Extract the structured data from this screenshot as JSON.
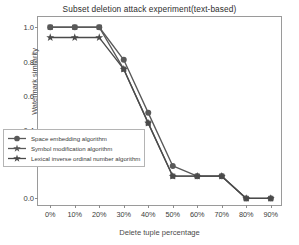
{
  "chart": {
    "title": "Subset deletion attack experiment(text-based)",
    "xlabel": "Delete tuple percentage",
    "ylabel": "Watermark similarity"
  },
  "chart_data": {
    "type": "line",
    "title": "Subset deletion attack experiment(text-based)",
    "xlabel": "Delete tuple percentage",
    "ylabel": "Watermark similarity",
    "categories": [
      "0%",
      "10%",
      "20%",
      "30%",
      "40%",
      "50%",
      "60%",
      "70%",
      "80%",
      "90%"
    ],
    "x_tick_labels": [
      "0%",
      "10%",
      "20%",
      "30%",
      "40%",
      "50%",
      "60%",
      "70%",
      "80%",
      "90%"
    ],
    "y_tick_labels": [
      "0.0",
      "0.2",
      "0.4",
      "0.6",
      "0.8",
      "1.0"
    ],
    "y_ticks": [
      0.0,
      0.2,
      0.4,
      0.6,
      0.8,
      1.0
    ],
    "ylim": [
      -0.05,
      1.06
    ],
    "xlim": [
      -0.5,
      9.5
    ],
    "grid": false,
    "legend_position": "lower left",
    "series": [
      {
        "name": "Space embedding algorithm",
        "marker": "circle",
        "color": "#595959",
        "values": [
          1.0,
          1.0,
          1.0,
          0.81,
          0.5,
          0.19,
          0.13,
          0.13,
          0.0,
          0.0
        ]
      },
      {
        "name": "Symbol modification algorithm",
        "marker": "square",
        "color": "#595959",
        "values": [
          1.0,
          1.0,
          1.0,
          0.755,
          0.44,
          0.13,
          0.13,
          0.13,
          0.0,
          0.0
        ]
      },
      {
        "name": "Lexical inverse ordinal number algorithm",
        "marker": "star",
        "color": "#4a4a4a",
        "values": [
          0.94,
          0.94,
          0.94,
          0.755,
          0.44,
          0.13,
          0.13,
          0.13,
          0.0,
          0.0
        ]
      }
    ]
  },
  "legend": {
    "items": [
      {
        "label": "Space embedding algorithm",
        "marker": "circle"
      },
      {
        "label": "Symbol modification algorithm",
        "marker": "star-small"
      },
      {
        "label": "Lexical inverse ordinal number algorithm",
        "marker": "star"
      }
    ]
  }
}
